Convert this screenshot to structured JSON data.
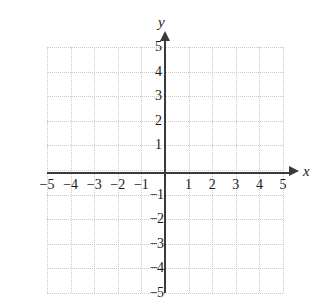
{
  "figure": {
    "kind": "cartesian-coordinate-plane",
    "background_color": "#ffffff",
    "axis_color": "#3a3a3a",
    "grid_color": "#c9c9c9",
    "label_color": "#1a1a1a"
  },
  "axes": {
    "x_name": "x",
    "y_name": "y",
    "x_arrow": "arrow-right",
    "y_arrow": "arrow-up"
  },
  "chart_data": {
    "type": "scatter",
    "title": "",
    "xlabel": "x",
    "ylabel": "y",
    "xlim": [
      -5,
      5
    ],
    "ylim": [
      -5,
      5
    ],
    "grid": true,
    "grid_step": 1,
    "legend": "none",
    "series": [],
    "x_ticks": [
      -5,
      -4,
      -3,
      -2,
      -1,
      1,
      2,
      3,
      4,
      5
    ],
    "y_ticks": [
      5,
      4,
      3,
      2,
      1,
      -1,
      -2,
      -3,
      -4,
      -5
    ],
    "x_tick_labels": [
      "−5",
      "−4",
      "−3",
      "−2",
      "−1",
      "1",
      "2",
      "3",
      "4",
      "5"
    ],
    "y_tick_labels_positive": [
      "5",
      "4",
      "3",
      "2",
      "1"
    ],
    "y_tick_labels_negative": [
      "−1",
      "−2",
      "−3",
      "−4",
      "−5"
    ],
    "annotations": [],
    "data_points": []
  }
}
